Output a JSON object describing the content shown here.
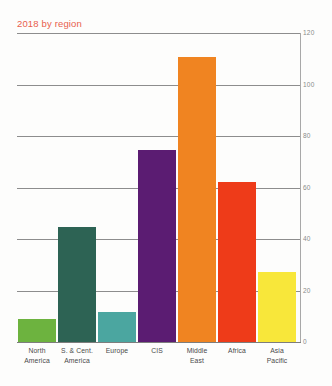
{
  "title": "2018 by region",
  "title_color": "#e8604c",
  "chart_data": {
    "type": "bar",
    "title": "2018 by region",
    "xlabel": "",
    "ylabel": "",
    "ylim": [
      0,
      120
    ],
    "yticks": [
      0,
      20,
      40,
      60,
      80,
      100,
      120
    ],
    "grid": true,
    "legend": "none",
    "categories": [
      "North America",
      "S. & Cent. America",
      "Europe",
      "CIS",
      "Middle East",
      "Africa",
      "Asia Pacific"
    ],
    "category_lines": [
      [
        "North",
        "America"
      ],
      [
        "S. & Cent.",
        "America"
      ],
      [
        "Europe",
        ""
      ],
      [
        "CIS",
        ""
      ],
      [
        "Middle",
        "East"
      ],
      [
        "Africa",
        ""
      ],
      [
        "Asia",
        "Pacific"
      ]
    ],
    "values": [
      9,
      44.5,
      11.5,
      74.5,
      110.5,
      62,
      27
    ],
    "colors": [
      "#6DB33F",
      "#2D6354",
      "#4BA6A0",
      "#5B1C72",
      "#F08421",
      "#EE3B19",
      "#F8E73A"
    ]
  },
  "axis": {
    "tick_labels": [
      "120",
      "100",
      "80",
      "60",
      "40",
      "20",
      "0"
    ]
  }
}
